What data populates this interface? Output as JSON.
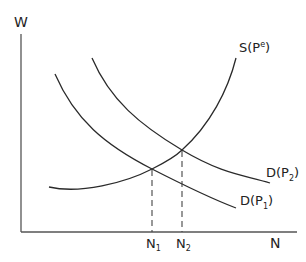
{
  "diagram": {
    "type": "labor market supply and demand",
    "axes": {
      "y_label": "W",
      "x_label": "N"
    },
    "curves": {
      "supply": {
        "label_main": "S(P",
        "label_sup": "e",
        "label_close": ")"
      },
      "demand_1": {
        "label_main": "D(P",
        "label_sub": "1",
        "label_close": ")"
      },
      "demand_2": {
        "label_main": "D(P",
        "label_sub": "2",
        "label_close": ")"
      }
    },
    "x_markers": [
      {
        "label_main": "N",
        "label_sub": "1"
      },
      {
        "label_main": "N",
        "label_sub": "2"
      }
    ],
    "colors": {
      "line": "#2a2a2a",
      "background": "#ffffff"
    }
  }
}
